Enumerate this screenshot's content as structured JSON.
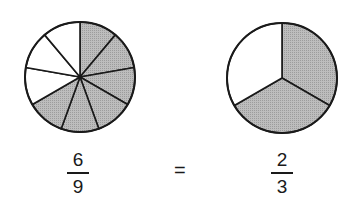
{
  "colors": {
    "shaded": "#b3b3b3",
    "unshaded": "#ffffff",
    "stroke": "#1a1a1a"
  },
  "left_pie": {
    "total_parts": 9,
    "shaded_parts": 6,
    "shaded_start": "top, going clockwise"
  },
  "right_pie": {
    "total_parts": 3,
    "shaded_parts": 2,
    "shaded_start": "top, going clockwise"
  },
  "equation": {
    "left_fraction": {
      "numerator": "6",
      "denominator": "9"
    },
    "operator": "=",
    "right_fraction": {
      "numerator": "2",
      "denominator": "3"
    }
  }
}
